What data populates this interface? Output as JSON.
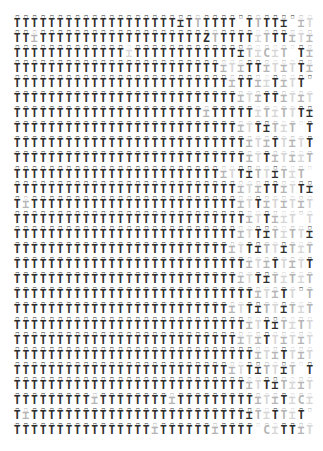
{
  "canvas": {
    "width": 323,
    "height": 451,
    "background": "#ffffff",
    "margin_left": 13,
    "margin_right": 10,
    "margin_top": 14,
    "margin_bottom": 15
  },
  "grid": {
    "columns": 35,
    "rows": 28,
    "column_pitch": 8.6,
    "row_pitch": 15.1
  },
  "glyphs": {
    "stem_primary": "T",
    "stem_alt_a": "⌶",
    "stem_alt_b": "⊤",
    "stem_alt_c": "Ʇ",
    "stem_alt_d": "C",
    "stem_alt_e": "I",
    "mark_primary": "□",
    "mark_alt_a": "○",
    "mark_alt_b": "◦",
    "mark_alt_c": "▫"
  },
  "colors": {
    "ink_dark": "#2e2e2e",
    "ink_mid": "#6f6f6f",
    "ink_light": "#b4b4b4",
    "ink_faint": "#d6d6d6",
    "background": "#ffffff"
  },
  "density_profile": {
    "description": "opacity gradient left to right",
    "solid_until_column": 22,
    "fade_start_column": 22,
    "fade_end_column": 34
  },
  "rows": [
    {
      "marks": "□□□□□□□□□□□□□□□□□□□□□□□□□□□□□□□□□□□",
      "stems": "TTTTTTTTTTTTTTTTTTT⌶TTTTTT TTTT⌶ ⌶T ⌶ T⌶T",
      "shades": "dddddddddddddddddddddlddddddlddddlfdlfdlfdlfd"
    },
    {
      "marks": "□□□□□□□□□□□□□□□□□□□□□□□□□□□□□□□□□□□",
      "stems": "TT⌶TTTTTTTTTTTTTTTTTTTZTTTTT⌶TTT⌶T⌶T⌶⌶T",
      "shades": "ddlddddddddddddddddddddlddddflddlflflflfd"
    },
    {
      "marks": "□□□□□□□□□□□□□□□□□□□□□□□□□□□□□□□□□□□",
      "stems": "TTTTTTTTTTTTT⌶TTTTTTTTTTTT⌶T⌶C⌶T T⌶",
      "shades": "dddddddddddddfdddddddddddddlflflfdlfl"
    },
    {
      "marks": "□□□□□□□□□□□□□□□□□□□□□□□□□□□□□□□□□□□",
      "stems": "TTTTTTTTTTTTTTTTTTTTTTTT⌶T⌶TT⌶T⌶TT⌶",
      "shades": "ddddddddddddddddddddddddlflddlflfdlf"
    },
    {
      "marks": "□□□□□□□□□□□□□□□□□□□□□□□□□□□□□□□□□□□",
      "stems": "TTTTTTTTTTTTTTTTTTTTTTTTT⌶TT⌶⌶T⌶TT T",
      "shades": "dddddddddddddddddddddddddlddlfdlfddlf"
    },
    {
      "marks": "□□□□□□□□□□□□□□□□□□□□□□□□□□□□□□□□□□□",
      "stems": "TTTTTTTTTTTTTTTTTTTTTTTTTT⌶T⌶TT⌶T⌶T",
      "shades": "ddddddddddddddddddddddddddlflddlflfd"
    },
    {
      "marks": "□□□□□□□□□□□□□□□□□□□□□□□□□□□□□□□□□□□",
      "stems": "TTTTTTTTTTTTTTTTTTTTTT⌶TTTTT⌶T⌶TTT⌶",
      "shades": "ddddddddddddddddddddddlddddd lflfddlf"
    },
    {
      "marks": "□□□□□□□□□□□□□□□□□□□□□□□□□□□□□□□□□□□",
      "stems": "TTTTTTTTTTTTTTTTTTTTTTTTTT⌶TT⌶T⌶T T",
      "shades": "ddddddddddddddddddddddddddlfddlflfdlf"
    },
    {
      "marks": "□□□□□□□□□□□□□□□□□□□□□□□□□□□□□□□□□□□",
      "stems": "TTTTTTTTTTTTTTTTTTTTTTTTTTT⌶T⌶TT⌶TT",
      "shades": "dddddddddddddddddddddddddddlfldflfddl"
    },
    {
      "marks": "□□□□□□□□□□□□□□□□□□□□□□□□□□□□□□□□□□□",
      "stems": "TTTTTTTTTTTTTTTTTTTTTTTTTTT⌶TT⌶T⌶⌶T",
      "shades": "dddddddddddddddddddddddddddlfdlflflfd"
    },
    {
      "marks": "□□□□□□□□□□□□□□□□□□□□□□□□□□□□□□□□□□□",
      "stems": "TTTTTTTTTTTTTTTTTTTTTTTT⌶TT⌶TT⌶T⌶T T",
      "shades": "ddddddddddddddddddddddddlfddlfdlflfdl"
    },
    {
      "marks": "□□□□□□□□□□□□□□□□□□□□□□□□□□□□□□□□□□□",
      "stems": "TTTTTTTTTTTTTTTTTTTTTTTTTT⌶T⌶TT⌶TT⌶",
      "shades": "ddddddddddddddddddddddddddlflddlfddlf"
    },
    {
      "marks": "□□□□□□□□□□□□□□□□□□□□□□□□□□□□□□□□□□□",
      "stems": "T⌶TTTTTTTTTTTTTTTTTTTTTTTT⌶TT⌶T⌶T⌶T",
      "shades": "dlddddddddddddddddddddddddlfdlflflfd"
    },
    {
      "marks": "□□□□□□□□□□□□□□□□□□□□□□□□□□□□□□□□□□□",
      "stems": "TTTTTTTTTTTTTTTTTTTTTTTTTTT⌶TT⌶⌶T T",
      "shades": "dddddddddddddddddddddddddddlfdlfflfdl"
    },
    {
      "marks": "□□□□□□□□□□□□□□□□□□□□□□□□□□□□□□□□□□□",
      "stems": "TTTTTTTTTTTTTTTTTTTTTTTTTT⌶TT⌶T⌶TT⌶",
      "shades": "ddddddddddddddddddddddddddlfddlflfddl"
    },
    {
      "marks": "□□□□□□□□□□□□□□□□□□□□□□□□□□□□□□□□□□□",
      "stems": "TTTTTTTTTTTTTTTTTTTTTTTTT⌶TT⌶TT⌶T⌶T",
      "shades": "dddddddddddddddddddddddddlfddlfdlflfd"
    },
    {
      "marks": "□□□□□□□□□□□□□□□□□□□□□□□□□□□□□□□□□□□",
      "stems": "TTTTTTTTTTTTTTTTTTTTTTTTTTT⌶T⌶TT⌶TT",
      "shades": "dddddddddddddddddddddddddddlfldflfddl"
    },
    {
      "marks": "□□□□□□□□□□□□□□□□□□□□□□□□□□□□□□□□□□□",
      "stems": "TTTTTTTTTTTTTTTTTTTTTTTTTT⌶TT⌶T⌶T⌶T",
      "shades": "ddddddddddddddddddddddddddlfddlflflfd"
    },
    {
      "marks": "□□□□□□□□□□□□□□□□□□□□□□□□□□□□□□□□□□□",
      "stems": "TTTTTTTTTTTTTTTTTTTTTTTTTTTT⌶T⌶TT T",
      "shades": "ddddddddddddddddddddddddddddlfldfdlfl"
    },
    {
      "marks": "□□□□□□□□□□□□□□□□□□□□□□□□□□□□□□□□□□□",
      "stems": "TTTTTTTTTTTTTTTTTTTTTTTTT⌶TT⌶TT⌶T⌶T",
      "shades": "dddddddddddddddddddddddddlfddlfdlflfd"
    },
    {
      "marks": "□□□□□□□□□□□□□□□□□□□□□□□□□□□□□□□□□□□",
      "stems": "TTTTTTTTTTTTTTTTTTTTTTTTTTT⌶TT⌶T⌶TT",
      "shades": "dddddddddddddddddddddddddddlfddlflfdl"
    },
    {
      "marks": "□□□□□□□□□□□□□□□□□□□□□□□□□□□□□□□□□□□",
      "stems": "TTTTTTTTTTTTTTTTTTTTTTTTTT⌶T⌶TT⌶T⌶T",
      "shades": "ddddddddddddddddddddddddddlfldflflfdl"
    },
    {
      "marks": "□□□□□□□□□□□□□□□□□□□□□□□□□□□□□□□□□□□",
      "stems": "TTTTTTTTTTTTTTTTTTTTTTTTTTTT⌶T⌶TT⌶T",
      "shades": "ddddddddddddddddddddddddddddlfldflfdl"
    },
    {
      "marks": "□□□□□□□□□□□□□□□□□□□□□□□□□□□□□□□□□□□",
      "stems": "TTTTTTTTTTTTTTTTTTTTTTTTT⌶TT⌶TT⌶T T",
      "shades": "dddddddddddddddddddddddddlfddlfdlfdlf"
    },
    {
      "marks": "□□□□□□□□□□□□□□□□□□□□□□□□□□□□□□□□□□□",
      "stems": "TTTTTTTTTTTTTTTTTTTTTTTTTTT⌶TT⌶T⌶⌶T",
      "shades": "dddddddddddddddddddddddddddlfddlflflf"
    },
    {
      "marks": "□□□□□□□□□□□□□□□□□□□□□□□□□□□□□□□□□□□",
      "stems": "TTTTTTTTT⌶TTTTTTTT⌶TTTTTTTTT⌶T⌶T⌶C⌶",
      "shades": "dddddddddlddddddddldddddddddlfldflflf"
    },
    {
      "marks": "□□□□□□□□□□□□□□□□□□□□□□□□□□□□□□□□□□□",
      "stems": "T⌶TTTTTTTTTTTTTTTTTTTTTTTTT⌶T⌶TT⌶T T",
      "shades": "dlddddddddddddddddddddddddddlfdlfdlfdl"
    },
    {
      "marks": "□□□□□□□□□□□□□□□□□□□□□□□□□□□□□□□□□□□",
      "stems": "TTTTTTTTTTTTTTTT⌶TTTTTT⌶TTTT C⌶TT⌶T⌶T",
      "shades": "ddddddddddddddddlddddddlddddflfddlfdlf"
    }
  ]
}
